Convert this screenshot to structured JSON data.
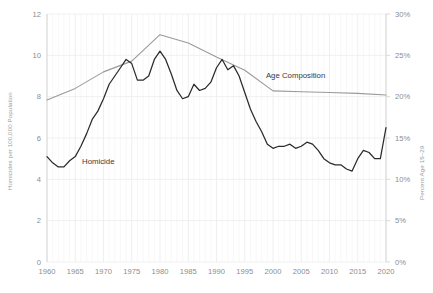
{
  "chart_data": {
    "type": "line",
    "title": "",
    "xlabel": "",
    "ylabel": "Homicides per 100,000 Population",
    "y2label": "Percent Age 15–29",
    "xlim": [
      1960,
      2020
    ],
    "ylim": [
      0,
      12
    ],
    "y2lim": [
      0,
      30
    ],
    "grid": true,
    "legend": "inline-annotations",
    "x_ticks": [
      "1960",
      "1965",
      "1970",
      "1975",
      "1980",
      "1985",
      "1990",
      "1995",
      "2000",
      "2005",
      "2010",
      "2015",
      "2020"
    ],
    "y_ticks": [
      "0",
      "2",
      "4",
      "6",
      "8",
      "10",
      "12"
    ],
    "y2_ticks": [
      "0%",
      "5%",
      "10%",
      "15%",
      "20%",
      "25%",
      "30%"
    ],
    "series": [
      {
        "name": "Homicide",
        "axis": "left",
        "color": "#2b2b2b",
        "label_x": 1966.2,
        "label_y": 4.72,
        "x": [
          1960,
          1961,
          1962,
          1963,
          1964,
          1965,
          1966,
          1967,
          1968,
          1969,
          1970,
          1971,
          1972,
          1973,
          1974,
          1975,
          1976,
          1977,
          1978,
          1979,
          1980,
          1981,
          1982,
          1983,
          1984,
          1985,
          1986,
          1987,
          1988,
          1989,
          1990,
          1991,
          1992,
          1993,
          1994,
          1995,
          1996,
          1997,
          1998,
          1999,
          2000,
          2001,
          2002,
          2003,
          2004,
          2005,
          2006,
          2007,
          2008,
          2009,
          2010,
          2011,
          2012,
          2013,
          2014,
          2015,
          2016,
          2017,
          2018,
          2019,
          2020
        ],
        "values": [
          5.1,
          4.8,
          4.6,
          4.6,
          4.9,
          5.1,
          5.6,
          6.2,
          6.9,
          7.3,
          7.9,
          8.6,
          9.0,
          9.4,
          9.8,
          9.6,
          8.8,
          8.8,
          9.0,
          9.8,
          10.2,
          9.8,
          9.1,
          8.3,
          7.9,
          8.0,
          8.6,
          8.3,
          8.4,
          8.7,
          9.4,
          9.8,
          9.3,
          9.5,
          9.0,
          8.2,
          7.4,
          6.8,
          6.3,
          5.7,
          5.5,
          5.6,
          5.6,
          5.7,
          5.5,
          5.6,
          5.8,
          5.7,
          5.4,
          5.0,
          4.8,
          4.7,
          4.7,
          4.5,
          4.4,
          5.0,
          5.4,
          5.3,
          5.0,
          5.0,
          6.5
        ]
      },
      {
        "name": "Age Composition",
        "axis": "right",
        "color": "#9a9a9a",
        "label_x": 2004.0,
        "label_y": 22.2,
        "x": [
          1960,
          1965,
          1970,
          1975,
          1980,
          1985,
          1990,
          1995,
          2000,
          2005,
          2010,
          2015,
          2020
        ],
        "values": [
          19.6,
          21.0,
          23.0,
          24.3,
          27.5,
          26.5,
          24.8,
          23.2,
          20.7,
          20.6,
          20.5,
          20.4,
          20.2
        ]
      }
    ]
  }
}
